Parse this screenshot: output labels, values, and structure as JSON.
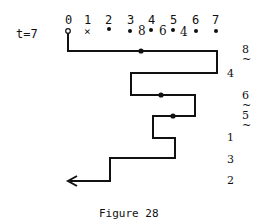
{
  "figure": {
    "time_label": "t=7",
    "indices": [
      "0",
      "1",
      "2",
      "3",
      "4",
      "5",
      "6",
      "7"
    ],
    "markers": [
      "open-circle",
      "x",
      "dot",
      "dot",
      "dot",
      "dot",
      "dot",
      "dot"
    ],
    "between_values": [
      "8",
      "6",
      "4"
    ],
    "side_labels": [
      {
        "value": "8",
        "tilde": true
      },
      {
        "value": "4",
        "tilde": false
      },
      {
        "value": "6",
        "tilde": true
      },
      {
        "value": "5",
        "tilde": true
      },
      {
        "value": "1",
        "tilde": false
      },
      {
        "value": "3",
        "tilde": false
      },
      {
        "value": "2",
        "tilde": false
      }
    ],
    "tilde_char": "~",
    "caption": "Figure 28"
  }
}
